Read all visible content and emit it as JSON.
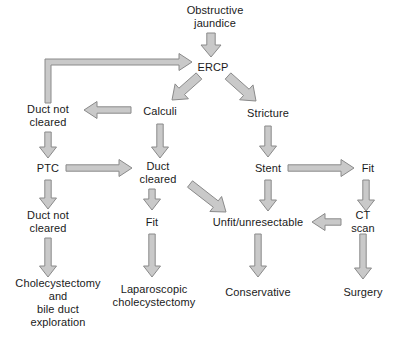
{
  "diagram": {
    "background_color": "#ffffff",
    "text_color": "#1a1a1a",
    "arrow_fill": "#c9c9c9",
    "arrow_stroke": "#8a8a8a",
    "nodes": [
      {
        "id": "obstructive_jaundice",
        "label": "Obstructive\njaundice",
        "x": 215,
        "y": 17
      },
      {
        "id": "ercp",
        "label": "ERCP",
        "x": 213,
        "y": 67
      },
      {
        "id": "calculi",
        "label": "Calculi",
        "x": 160,
        "y": 111
      },
      {
        "id": "stricture",
        "label": "Stricture",
        "x": 268,
        "y": 113
      },
      {
        "id": "duct_not_cleared_1",
        "label": "Duct not\ncleared",
        "x": 48,
        "y": 116
      },
      {
        "id": "ptc",
        "label": "PTC",
        "x": 48,
        "y": 168
      },
      {
        "id": "duct_cleared",
        "label": "Duct\ncleared",
        "x": 158,
        "y": 173
      },
      {
        "id": "stent",
        "label": "Stent",
        "x": 268,
        "y": 168
      },
      {
        "id": "fit_right",
        "label": "Fit",
        "x": 368,
        "y": 168
      },
      {
        "id": "duct_not_cleared_2",
        "label": "Duct not\ncleared",
        "x": 48,
        "y": 222
      },
      {
        "id": "fit_middle",
        "label": "Fit",
        "x": 152,
        "y": 222
      },
      {
        "id": "unfit_unresectable",
        "label": "Unfit/unresectable",
        "x": 258,
        "y": 222
      },
      {
        "id": "ct_scan",
        "label": "CT scan",
        "x": 363,
        "y": 222
      },
      {
        "id": "cholecystectomy",
        "label": "Cholecystectomy\nand\nbile duct\nexploration",
        "x": 58,
        "y": 303
      },
      {
        "id": "laparoscopic_cholecystectomy",
        "label": "Laparoscopic\ncholecystectomy",
        "x": 154,
        "y": 296
      },
      {
        "id": "conservative",
        "label": "Conservative",
        "x": 258,
        "y": 292
      },
      {
        "id": "surgery",
        "label": "Surgery",
        "x": 363,
        "y": 292
      }
    ],
    "edges": [
      {
        "id": "jaundice-to-ercp",
        "from": "obstructive_jaundice",
        "to": "ercp",
        "kind": "down"
      },
      {
        "id": "ercp-to-calculi",
        "from": "ercp",
        "to": "calculi",
        "kind": "diagonal-down-left"
      },
      {
        "id": "ercp-to-stricture",
        "from": "ercp",
        "to": "stricture",
        "kind": "diagonal-down-right"
      },
      {
        "id": "calculi-to-duct-not-cleared",
        "from": "calculi",
        "to": "duct_not_cleared_1",
        "kind": "left"
      },
      {
        "id": "calculi-to-duct-cleared",
        "from": "calculi",
        "to": "duct_cleared",
        "kind": "down"
      },
      {
        "id": "duct-not-cleared-to-ercp",
        "from": "duct_not_cleared_1",
        "to": "ercp",
        "kind": "elbow-up-right"
      },
      {
        "id": "duct-not-cleared-to-ptc",
        "from": "duct_not_cleared_1",
        "to": "ptc",
        "kind": "down"
      },
      {
        "id": "ptc-to-duct-cleared",
        "from": "ptc",
        "to": "duct_cleared",
        "kind": "right"
      },
      {
        "id": "ptc-to-duct-not-cleared-2",
        "from": "ptc",
        "to": "duct_not_cleared_2",
        "kind": "down"
      },
      {
        "id": "duct-cleared-to-fit",
        "from": "duct_cleared",
        "to": "fit_middle",
        "kind": "down"
      },
      {
        "id": "duct-cleared-to-unfit",
        "from": "duct_cleared",
        "to": "unfit_unresectable",
        "kind": "diagonal-down-right"
      },
      {
        "id": "stricture-to-stent",
        "from": "stricture",
        "to": "stent",
        "kind": "down"
      },
      {
        "id": "stent-to-fit-right",
        "from": "stent",
        "to": "fit_right",
        "kind": "right"
      },
      {
        "id": "stent-to-unfit",
        "from": "stent",
        "to": "unfit_unresectable",
        "kind": "down"
      },
      {
        "id": "fit-right-to-ct-scan",
        "from": "fit_right",
        "to": "ct_scan",
        "kind": "down"
      },
      {
        "id": "ct-scan-to-unfit",
        "from": "ct_scan",
        "to": "unfit_unresectable",
        "kind": "left"
      },
      {
        "id": "ct-scan-to-surgery",
        "from": "ct_scan",
        "to": "surgery",
        "kind": "down"
      },
      {
        "id": "duct-not-cleared-2-to-cholecystectomy",
        "from": "duct_not_cleared_2",
        "to": "cholecystectomy",
        "kind": "down"
      },
      {
        "id": "fit-middle-to-laparoscopic",
        "from": "fit_middle",
        "to": "laparoscopic_cholecystectomy",
        "kind": "down"
      },
      {
        "id": "unfit-to-conservative",
        "from": "unfit_unresectable",
        "to": "conservative",
        "kind": "down"
      }
    ]
  }
}
